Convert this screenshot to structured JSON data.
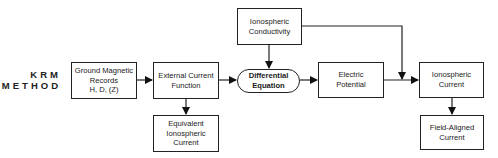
{
  "method_label": {
    "line1": "KRM",
    "line2": "METHOD"
  },
  "nodes": {
    "ground_records": {
      "line1": "Ground Magnetic",
      "line2": "Records",
      "line3": "H, D, (Z)"
    },
    "external_current": {
      "line1": "External Current",
      "line2": "Function"
    },
    "equivalent_current": {
      "line1": "Equivalent",
      "line2": "Ionospheric",
      "line3": "Current"
    },
    "conductivity": {
      "line1": "Ionospheric",
      "line2": "Conductivity"
    },
    "differential_eq": {
      "line1": "Differential",
      "line2": "Equation"
    },
    "electric_potential": {
      "line1": "Electric",
      "line2": "Potential"
    },
    "ionospheric_current": {
      "line1": "Ionospheric",
      "line2": "Current"
    },
    "field_aligned": {
      "line1": "Field-Aligned",
      "line2": "Current"
    }
  },
  "edges": [
    {
      "from": "Ground Magnetic Records",
      "to": "External Current Function"
    },
    {
      "from": "External Current Function",
      "to": "Equivalent Ionospheric Current"
    },
    {
      "from": "External Current Function",
      "to": "Differential Equation"
    },
    {
      "from": "Ionospheric Conductivity",
      "to": "Differential Equation"
    },
    {
      "from": "Differential Equation",
      "to": "Electric Potential"
    },
    {
      "from": "Electric Potential",
      "to": "Ionospheric Current"
    },
    {
      "from": "Ionospheric Conductivity",
      "to": "Ionospheric Current"
    },
    {
      "from": "Ionospheric Current",
      "to": "Field-Aligned Current"
    }
  ]
}
